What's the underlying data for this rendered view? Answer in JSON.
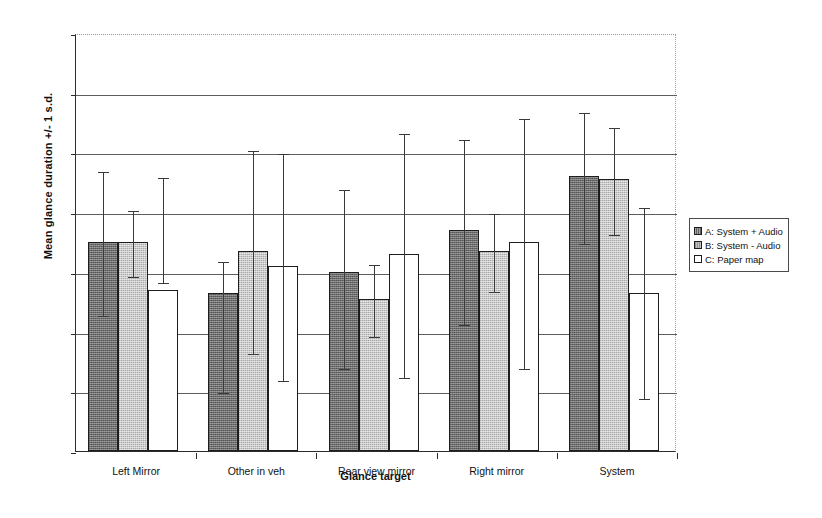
{
  "chart_data": {
    "type": "bar",
    "title": "",
    "xlabel": "Glance target",
    "ylabel": "Mean glance duration +/- 1 s.d.",
    "ylim": [
      0,
      1.4
    ],
    "yticks": [
      "0",
      "0.2",
      "0.4",
      "0.6",
      "0.8",
      "1",
      "1.2",
      "1.4"
    ],
    "ytick_values": [
      0,
      0.2,
      0.4,
      0.6,
      0.8,
      1.0,
      1.2,
      1.4
    ],
    "grid": "horizontal",
    "legend_position": "right",
    "error_bars": "1 s.d.",
    "categories": [
      "Left Mirror",
      "Other in veh",
      "Rear view mirror",
      "Right mirror",
      "System"
    ],
    "series": [
      {
        "name": "A: System + Audio",
        "key": "A",
        "color": "#6e6e6e",
        "values": [
          0.7,
          0.53,
          0.6,
          0.74,
          0.92
        ],
        "err_low": [
          0.46,
          0.2,
          0.28,
          0.43,
          0.7
        ],
        "err_high": [
          0.94,
          0.64,
          0.88,
          1.05,
          1.14
        ]
      },
      {
        "name": "B: System - Audio",
        "key": "B",
        "color": "#c9c9c9",
        "values": [
          0.7,
          0.67,
          0.51,
          0.67,
          0.91
        ],
        "err_low": [
          0.59,
          0.33,
          0.39,
          0.54,
          0.73
        ],
        "err_high": [
          0.81,
          1.01,
          0.63,
          0.8,
          1.09
        ]
      },
      {
        "name": "C: Paper map",
        "key": "C",
        "color": "#ffffff",
        "values": [
          0.54,
          0.62,
          0.66,
          0.7,
          0.53
        ],
        "err_low": [
          0.57,
          0.24,
          0.25,
          0.28,
          0.18
        ],
        "err_high": [
          0.92,
          1.0,
          1.07,
          1.12,
          0.82
        ]
      }
    ]
  },
  "legend": {
    "items": [
      {
        "swatch": "A",
        "label": "A: System + Audio"
      },
      {
        "swatch": "B",
        "label": "B: System - Audio"
      },
      {
        "swatch": "C",
        "label": "C: Paper map"
      }
    ]
  }
}
